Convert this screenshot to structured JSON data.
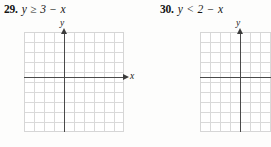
{
  "page": {
    "background": "#fdfdfc",
    "kind": "textbook-exercise-fragment"
  },
  "problems": [
    {
      "number": "29.",
      "expression": "y ≥ 3 − x",
      "inequality_symbol": "≥",
      "graph": {
        "x_axis_label": "x",
        "y_axis_label": "y",
        "show_x_label": true,
        "show_x_arrow": true,
        "show_y_arrow": true,
        "grid_columns": 10,
        "grid_rows": 10,
        "origin_col": 4,
        "origin_row": 4,
        "grid_color": "#d9d9d9",
        "axis_color": "#4a4a4a",
        "plotted": false
      }
    },
    {
      "number": "30.",
      "expression": "y < 2 − x",
      "inequality_symbol": "<",
      "graph": {
        "x_axis_label": "x",
        "y_axis_label": "y",
        "show_x_label": false,
        "show_x_arrow": false,
        "show_y_arrow": true,
        "grid_columns": 10,
        "grid_rows": 10,
        "origin_col": 4,
        "origin_row": 4,
        "grid_color": "#d9d9d9",
        "axis_color": "#4a4a4a",
        "plotted": false
      }
    }
  ]
}
